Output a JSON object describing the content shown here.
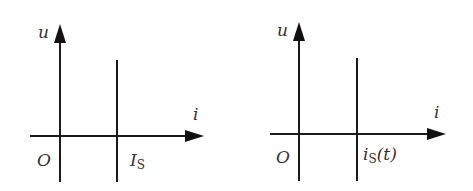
{
  "diagrams": [
    {
      "id": "left",
      "y_axis_label": "u",
      "x_axis_label": "i",
      "origin_label": "O",
      "source_label_main": "I",
      "source_label_sub": "S",
      "source_label_suffix": ""
    },
    {
      "id": "right",
      "y_axis_label": "u",
      "x_axis_label": "i",
      "origin_label": "O",
      "source_label_main": "i",
      "source_label_sub": "S",
      "source_label_suffix": "(t)"
    }
  ]
}
